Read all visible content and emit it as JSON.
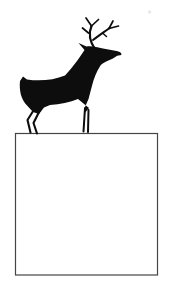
{
  "figure": {
    "elements": [
      "deer-silhouette",
      "square-frame",
      "paper-smudge-artifact"
    ]
  },
  "colors": {
    "background": "#ffffff",
    "deer": "#0d0d0d",
    "frame_border": "#454545",
    "smudge": "#d9d9d9"
  }
}
